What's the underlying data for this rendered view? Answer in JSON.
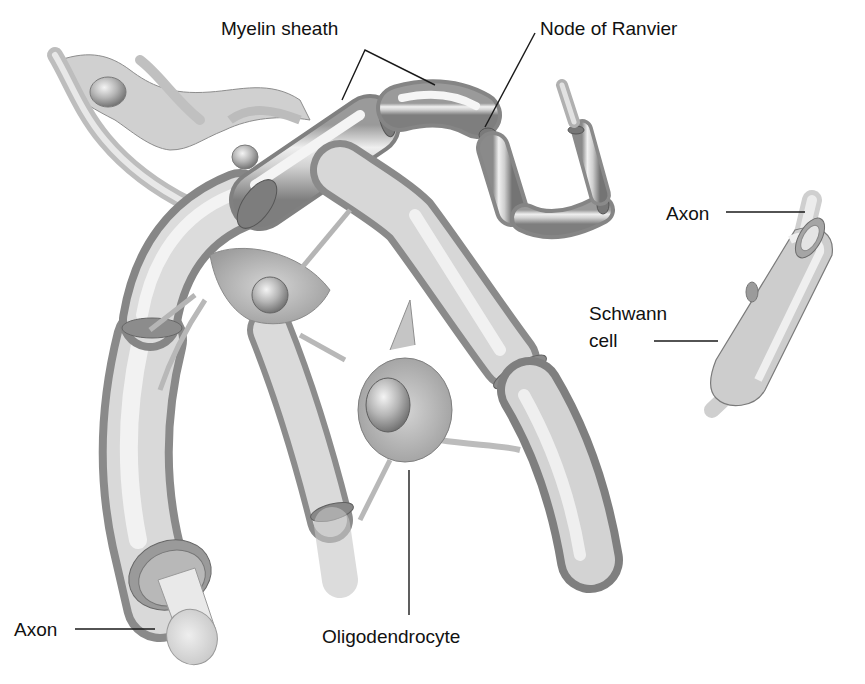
{
  "diagram": {
    "style": "grayscale anatomical illustration",
    "colors": {
      "background": "#ffffff",
      "label_text": "#111111",
      "leader_line": "#1a1a1a",
      "tissue_light": "#ececec",
      "tissue_mid": "#bdbdbd",
      "tissue_dark": "#7a7a7a",
      "axon_core": "#e6e6e6"
    },
    "labels": {
      "myelin_sheath": "Myelin sheath",
      "node_of_ranvier": "Node of Ranvier",
      "axon_right": "Axon",
      "schwann_cell_line1": "Schwann",
      "schwann_cell_line2": "cell",
      "axon_left": "Axon",
      "oligodendrocyte": "Oligodendrocyte"
    },
    "structures": [
      "oligodendrocyte cell bodies",
      "myelinated axon segments (CNS)",
      "nodes of Ranvier",
      "exposed axon cross-section",
      "Schwann cell wrapping axon (PNS)"
    ]
  }
}
